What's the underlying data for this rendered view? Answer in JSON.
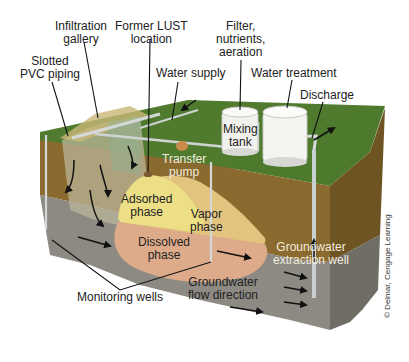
{
  "figure": {
    "type": "cross-section diagram"
  },
  "labels": {
    "infiltration_gallery": [
      "Infiltration",
      "gallery"
    ],
    "former_lust_location": [
      "Former LUST",
      "location"
    ],
    "slotted_pvc_piping": [
      "Slotted",
      "PVC piping"
    ],
    "water_supply": "Water supply",
    "filter_nutrients_aeration": [
      "Filter,",
      "nutrients,",
      "aeration"
    ],
    "water_treatment": "Water treatment",
    "discharge": "Discharge",
    "mixing_tank": [
      "Mixing",
      "tank"
    ],
    "transfer_pump": [
      "Transfer",
      "pump"
    ],
    "adsorbed_phase": [
      "Adsorbed",
      "phase"
    ],
    "vapor_phase": [
      "Vapor",
      "phase"
    ],
    "dissolved_phase": [
      "Dissolved",
      "phase"
    ],
    "groundwater_extraction_well": [
      "Groundwater",
      "extraction well"
    ],
    "groundwater_flow_direction": [
      "Groundwater",
      "flow direction"
    ],
    "monitoring_wells": "Monitoring wells"
  },
  "credit": "© Delmar, Cengage Learning",
  "colors": {
    "grass": "#4f7a2e",
    "grass_dark": "#3f6a25",
    "soil": "#8a6a2e",
    "soil_side": "#6e5422",
    "gravel": "#8c8a82",
    "gravel_side": "#6f6d66",
    "adsorbed": "#ecdf86",
    "vapor": "#e3c47e",
    "dissolved": "#deab8a",
    "infiltration_zone": "#b9b49a",
    "tank": "#f3f3f0",
    "pipe": "#cfd3d4",
    "pump": "#c98a4a"
  }
}
